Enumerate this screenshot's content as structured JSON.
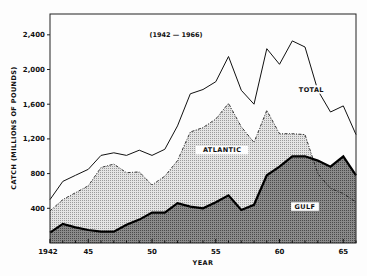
{
  "chart_data": {
    "type": "area",
    "title": "(1942 — 1966)",
    "xlabel": "YEAR",
    "ylabel": "CATCH (MILLIONS OF POUNDS)",
    "x": [
      1942,
      1943,
      1944,
      1945,
      1946,
      1947,
      1948,
      1949,
      1950,
      1951,
      1952,
      1953,
      1954,
      1955,
      1956,
      1957,
      1958,
      1959,
      1960,
      1961,
      1962,
      1963,
      1964,
      1965,
      1966
    ],
    "x_tick_labels": [
      "1942",
      "45",
      "50",
      "55",
      "60",
      "65"
    ],
    "x_tick_values": [
      1942,
      1945,
      1950,
      1955,
      1960,
      1965
    ],
    "y_tick_labels": [
      "400",
      "800",
      "1,200",
      "1,600",
      "2,000",
      "2,400"
    ],
    "y_tick_values": [
      400,
      800,
      1200,
      1600,
      2000,
      2400
    ],
    "ylim": [
      0,
      2640
    ],
    "xlim": [
      1942,
      1966
    ],
    "grid": false,
    "series": [
      {
        "name": "TOTAL",
        "style": "line",
        "values": [
          500,
          710,
          780,
          850,
          1010,
          1040,
          1010,
          1070,
          1010,
          1080,
          1350,
          1720,
          1770,
          1860,
          2150,
          1760,
          1600,
          2240,
          2060,
          2330,
          2260,
          1760,
          1510,
          1580,
          1250
        ]
      },
      {
        "name": "ATLANTIC",
        "style": "dashed-dotted-fill",
        "values": [
          370,
          500,
          580,
          660,
          870,
          910,
          810,
          820,
          670,
          770,
          950,
          1280,
          1330,
          1430,
          1610,
          1340,
          1160,
          1530,
          1260,
          1260,
          1250,
          800,
          630,
          570,
          470
        ]
      },
      {
        "name": "GULF",
        "style": "dark-dotted-fill",
        "values": [
          120,
          220,
          180,
          150,
          130,
          130,
          210,
          270,
          350,
          350,
          460,
          420,
          400,
          470,
          550,
          380,
          440,
          780,
          880,
          1000,
          1000,
          950,
          880,
          1000,
          780
        ]
      }
    ],
    "annotations": [
      {
        "text": "TOTAL",
        "x": 1962.5,
        "y": 1750
      },
      {
        "text": "ATLANTIC",
        "x": 1955.5,
        "y": 1050
      },
      {
        "text": "GULF",
        "x": 1962,
        "y": 400
      }
    ]
  }
}
